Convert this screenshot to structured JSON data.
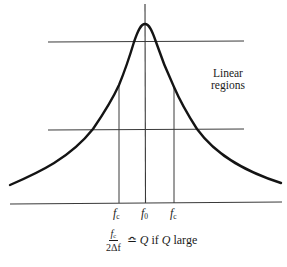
{
  "figure": {
    "type": "resonance-curve",
    "annotation": {
      "line1": "Linear",
      "line2": "regions"
    },
    "ticks": [
      {
        "id": "fc_left",
        "symbol": "f",
        "subscript": "c",
        "x": 119
      },
      {
        "id": "f0",
        "symbol": "f",
        "subscript": "0",
        "x": 145
      },
      {
        "id": "fc_right",
        "symbol": "f",
        "subscript": "c",
        "x": 174
      }
    ],
    "formula": {
      "numerator_symbol": "f",
      "numerator_subscript": "c",
      "denominator": "2Δf",
      "relation": "≏",
      "q1": "Q",
      "if_word": "if",
      "q2": "Q",
      "tail": "large",
      "full_text": "fc / 2Δf ≏ Q if Q large"
    },
    "geometry": {
      "upper_reference_line": {
        "x1": 48,
        "y1": 42,
        "x2": 244,
        "y2": 41
      },
      "lower_reference_line": {
        "x1": 48,
        "y1": 130,
        "x2": 244,
        "y2": 129
      },
      "baseline": {
        "x1": 10,
        "y1": 204,
        "x2": 282,
        "y2": 202
      },
      "center_line": {
        "x": 145,
        "y_top": 4,
        "y_bottom": 203
      },
      "peak": {
        "x": 145,
        "y": 24
      },
      "fc_lines": {
        "y_top_left": 85,
        "y_top_right": 87,
        "y_bottom": 203
      },
      "curve_endpoints": {
        "left": [
          10,
          185
        ],
        "right": [
          281,
          183
        ]
      }
    },
    "colors": {
      "background": "#ffffff",
      "curve": "#141414",
      "lines": "#3a3a3a",
      "text": "#1a1a1a"
    }
  }
}
